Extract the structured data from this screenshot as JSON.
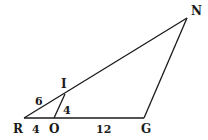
{
  "diagram": {
    "type": "triangle",
    "points": {
      "R": {
        "x": 24,
        "y": 118
      },
      "O": {
        "x": 54,
        "y": 118
      },
      "G": {
        "x": 144,
        "y": 118
      },
      "N": {
        "x": 187,
        "y": 18
      },
      "I": {
        "x": 65,
        "y": 94
      }
    },
    "segments": [
      {
        "from": "R",
        "to": "N"
      },
      {
        "from": "N",
        "to": "G"
      },
      {
        "from": "R",
        "to": "G"
      },
      {
        "from": "I",
        "to": "O"
      }
    ],
    "vertex_labels": {
      "R": "R",
      "O": "O",
      "G": "G",
      "N": "N",
      "I": "I"
    },
    "measurements": {
      "RI": "6",
      "IO": "4",
      "RO": "4",
      "OG": "12"
    },
    "colors": {
      "line": "#1a1a1a",
      "background": "#ffffff"
    }
  }
}
